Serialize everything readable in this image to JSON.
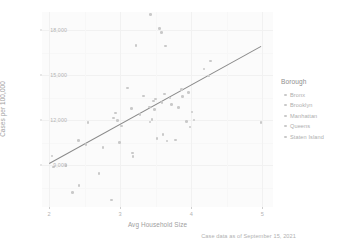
{
  "chart_data": {
    "type": "scatter",
    "title": "",
    "xlabel": "Avg Household Size",
    "ylabel": "Cases per 100,000",
    "caption": "Case data as of September 15, 2021",
    "xlim": [
      1.9,
      5.15
    ],
    "ylim": [
      6200,
      19200
    ],
    "xticks": [
      "2",
      "3",
      "4",
      "5"
    ],
    "xtick_values": [
      2,
      3,
      4,
      5
    ],
    "yticks": [
      "18,000",
      "15,000",
      "12,000",
      "9,000"
    ],
    "ytick_values": [
      18000,
      15000,
      12000,
      9000
    ],
    "grid": true,
    "legend": {
      "title": "Borough",
      "position": "right",
      "entries": [
        {
          "label": "Bronx",
          "color": "#c9c9c9"
        },
        {
          "label": "Brooklyn",
          "color": "#c9c9c9"
        },
        {
          "label": "Manhattan",
          "color": "#c9c9c9"
        },
        {
          "label": "Queens",
          "color": "#c9c9c9"
        },
        {
          "label": "Staten Island",
          "color": "#c9c9c9"
        }
      ]
    },
    "trend_line": {
      "type": "linear-fit",
      "x_start": 2.0,
      "y_start": 9150,
      "x_end": 4.98,
      "y_end": 16950,
      "color": "#8a8a8a"
    },
    "points": [
      {
        "x": 2.04,
        "y": 9600
      },
      {
        "x": 2.06,
        "y": 8880
      },
      {
        "x": 2.24,
        "y": 8960
      },
      {
        "x": 2.33,
        "y": 7180
      },
      {
        "x": 2.41,
        "y": 10640
      },
      {
        "x": 2.42,
        "y": 7620
      },
      {
        "x": 2.52,
        "y": 10380
      },
      {
        "x": 2.55,
        "y": 11840
      },
      {
        "x": 2.7,
        "y": 8450
      },
      {
        "x": 2.76,
        "y": 10180
      },
      {
        "x": 2.88,
        "y": 6660
      },
      {
        "x": 2.91,
        "y": 12130
      },
      {
        "x": 2.93,
        "y": 12470
      },
      {
        "x": 2.96,
        "y": 11950
      },
      {
        "x": 2.99,
        "y": 10500
      },
      {
        "x": 3.02,
        "y": 11600
      },
      {
        "x": 3.1,
        "y": 14120
      },
      {
        "x": 3.16,
        "y": 12750
      },
      {
        "x": 3.17,
        "y": 9800
      },
      {
        "x": 3.18,
        "y": 9580
      },
      {
        "x": 3.22,
        "y": 16960
      },
      {
        "x": 3.28,
        "y": 12380
      },
      {
        "x": 3.33,
        "y": 13600
      },
      {
        "x": 3.41,
        "y": 12870
      },
      {
        "x": 3.42,
        "y": 11880
      },
      {
        "x": 3.43,
        "y": 19050
      },
      {
        "x": 3.45,
        "y": 12020
      },
      {
        "x": 3.47,
        "y": 13260
      },
      {
        "x": 3.48,
        "y": 12710
      },
      {
        "x": 3.5,
        "y": 13390
      },
      {
        "x": 3.52,
        "y": 10780
      },
      {
        "x": 3.55,
        "y": 18100
      },
      {
        "x": 3.58,
        "y": 17820
      },
      {
        "x": 3.59,
        "y": 13150
      },
      {
        "x": 3.6,
        "y": 11020
      },
      {
        "x": 3.62,
        "y": 13740
      },
      {
        "x": 3.64,
        "y": 16930
      },
      {
        "x": 3.66,
        "y": 10590
      },
      {
        "x": 3.7,
        "y": 13460
      },
      {
        "x": 3.72,
        "y": 13030
      },
      {
        "x": 3.78,
        "y": 10660
      },
      {
        "x": 3.82,
        "y": 12850
      },
      {
        "x": 3.86,
        "y": 14030
      },
      {
        "x": 3.88,
        "y": 13570
      },
      {
        "x": 3.93,
        "y": 11900
      },
      {
        "x": 3.96,
        "y": 13840
      },
      {
        "x": 3.98,
        "y": 11520
      },
      {
        "x": 4.01,
        "y": 12530
      },
      {
        "x": 4.04,
        "y": 12000
      },
      {
        "x": 4.18,
        "y": 15390
      },
      {
        "x": 4.24,
        "y": 14940
      },
      {
        "x": 4.27,
        "y": 15920
      },
      {
        "x": 4.98,
        "y": 11830
      }
    ]
  }
}
